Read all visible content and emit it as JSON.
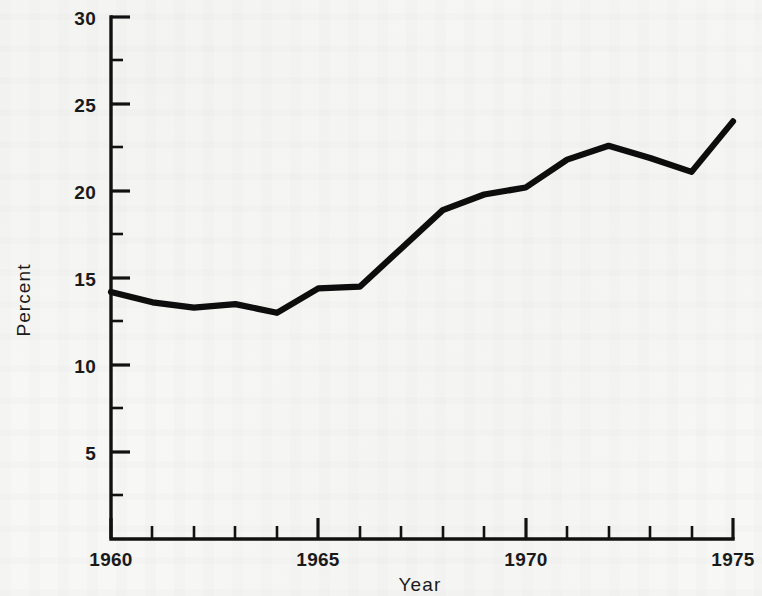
{
  "figure": {
    "background_color": "#f7f7f5",
    "ink_color": "#0d0d0d",
    "media": "scanned-paper"
  },
  "axes": {
    "y_title": "Percent",
    "x_title": "Year",
    "y_ticks": [
      "5",
      "10",
      "15",
      "20",
      "25",
      "30"
    ],
    "x_ticks": [
      "1960",
      "1965",
      "1970",
      "1975"
    ]
  },
  "chart_data": {
    "type": "line",
    "title": "",
    "xlabel": "Year",
    "ylabel": "Percent",
    "xlim": [
      1959,
      1975
    ],
    "ylim": [
      0,
      30
    ],
    "grid": false,
    "legend": "none",
    "x_tick_labels": [
      "1960",
      "1965",
      "1970",
      "1975"
    ],
    "x_tick_values": [
      1960,
      1965,
      1970,
      1975
    ],
    "x_minor_tick_step": 1,
    "y_tick_labels": [
      "5",
      "10",
      "15",
      "20",
      "25",
      "30"
    ],
    "y_tick_values": [
      5,
      10,
      15,
      20,
      25,
      30
    ],
    "y_minor_tick_step": 2.5,
    "x": [
      1960,
      1961,
      1962,
      1963,
      1964,
      1965,
      1966,
      1967,
      1968,
      1969,
      1970,
      1971,
      1972,
      1973,
      1974,
      1975
    ],
    "values": [
      14.2,
      13.6,
      13.3,
      13.5,
      13.0,
      14.4,
      14.5,
      16.7,
      18.9,
      19.8,
      20.2,
      21.8,
      22.6,
      21.9,
      21.1,
      24.0
    ],
    "series": [
      {
        "name": "Percent",
        "values": [
          14.2,
          13.6,
          13.3,
          13.5,
          13.0,
          14.4,
          14.5,
          16.7,
          18.9,
          19.8,
          20.2,
          21.8,
          22.6,
          21.9,
          21.1,
          24.0
        ]
      }
    ]
  }
}
